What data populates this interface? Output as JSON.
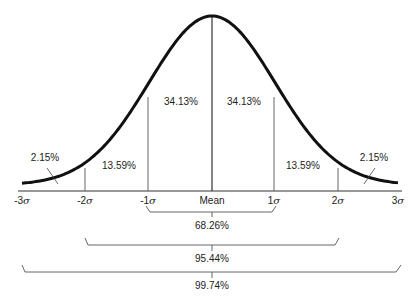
{
  "chart_data": {
    "type": "area",
    "title": "",
    "xlabel": "",
    "ylabel": "",
    "x_ticks": [
      "-3σ",
      "-2σ",
      "-1σ",
      "Mean",
      "1σ",
      "2σ",
      "3σ"
    ],
    "x_values": [
      -3,
      -2,
      -1,
      0,
      1,
      2,
      3
    ],
    "regions": [
      {
        "from": -3,
        "to": -2,
        "percent": 2.15,
        "label": "2.15%"
      },
      {
        "from": -2,
        "to": -1,
        "percent": 13.59,
        "label": "13.59%"
      },
      {
        "from": -1,
        "to": 0,
        "percent": 34.13,
        "label": "34.13%"
      },
      {
        "from": 0,
        "to": 1,
        "percent": 34.13,
        "label": "34.13%"
      },
      {
        "from": 1,
        "to": 2,
        "percent": 13.59,
        "label": "13.59%"
      },
      {
        "from": 2,
        "to": 3,
        "percent": 2.15,
        "label": "2.15%"
      }
    ],
    "brackets": [
      {
        "from": -1,
        "to": 1,
        "percent": 68.26,
        "label": "68.26%"
      },
      {
        "from": -2,
        "to": 2,
        "percent": 95.44,
        "label": "95.44%"
      },
      {
        "from": -3,
        "to": 3,
        "percent": 99.74,
        "label": "99.74%"
      }
    ],
    "grid": false,
    "legend": null
  },
  "labels": {
    "r_m3_m2": "2.15%",
    "r_m2_m1": "13.59%",
    "r_m1_0": "34.13%",
    "r_0_1": "34.13%",
    "r_1_2": "13.59%",
    "r_2_3": "2.15%",
    "b1": "68.26%",
    "b2": "95.44%",
    "b3": "99.74%"
  },
  "axis": {
    "m3": "-3",
    "m2": "-2",
    "m1": "-1",
    "mean": "Mean",
    "p1": "1",
    "p2": "2",
    "p3": "3",
    "sigma": "σ"
  },
  "colors": {
    "curve": "#111111",
    "lines": "#555555"
  }
}
